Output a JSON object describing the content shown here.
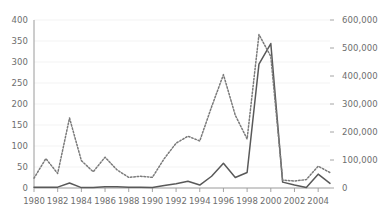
{
  "chart_data": {
    "type": "line",
    "title": "",
    "subtitle": "",
    "xlabel": "",
    "ylabel": "",
    "y2label": "",
    "grid": true,
    "legend": "none",
    "x": [
      1980,
      1981,
      1982,
      1983,
      1984,
      1985,
      1986,
      1987,
      1988,
      1989,
      1990,
      1991,
      1992,
      1993,
      1994,
      1995,
      1996,
      1997,
      1998,
      1999,
      2000,
      2001,
      2002,
      2003,
      2004,
      2005
    ],
    "x_tick_labels": [
      "1980",
      "1982",
      "1984",
      "1986",
      "1988",
      "1990",
      "1992",
      "1994",
      "1996",
      "1998",
      "2000",
      "2002",
      "2004"
    ],
    "x_ticks": [
      1980,
      1982,
      1984,
      1986,
      1988,
      1990,
      1992,
      1994,
      1996,
      1998,
      2000,
      2002,
      2004
    ],
    "xlim": [
      1980,
      2005
    ],
    "left_axis": {
      "ylim": [
        0,
        400
      ],
      "ticks": [
        0,
        50,
        100,
        150,
        200,
        250,
        300,
        350,
        400
      ],
      "tick_labels": [
        "0",
        "50",
        "100",
        "150",
        "200",
        "250",
        "300",
        "350",
        "400"
      ]
    },
    "right_axis": {
      "ylim": [
        0,
        600000
      ],
      "ticks": [
        0,
        100000,
        200000,
        300000,
        400000,
        500000,
        600000
      ],
      "tick_labels": [
        "0",
        "100,000",
        "200,000",
        "300,000",
        "400,000",
        "500,000",
        "600,000"
      ]
    },
    "series": [
      {
        "name": "solid-series",
        "style": "solid",
        "axis": "left",
        "color": "#595959",
        "values": [
          2,
          2,
          2,
          12,
          1,
          1,
          3,
          3,
          2,
          2,
          1,
          6,
          10,
          16,
          7,
          28,
          59,
          25,
          37,
          295,
          344,
          14,
          7,
          1,
          33,
          11
        ]
      },
      {
        "name": "dotted-series",
        "style": "dotted",
        "axis": "right",
        "color": "#7a7a7a",
        "values": [
          35000,
          105000,
          52000,
          250000,
          98000,
          58000,
          110000,
          65000,
          38000,
          42000,
          38000,
          105000,
          160000,
          185000,
          168000,
          290000,
          405000,
          260000,
          175000,
          548000,
          470000,
          28000,
          25000,
          30000,
          78000,
          55000
        ]
      }
    ]
  },
  "colors": {
    "axis": "#9a9a9a",
    "grid": "#f0f0f0",
    "text": "#6e6e6e",
    "solid_series": "#595959",
    "dotted_series": "#7a7a7a",
    "background": "#ffffff"
  }
}
